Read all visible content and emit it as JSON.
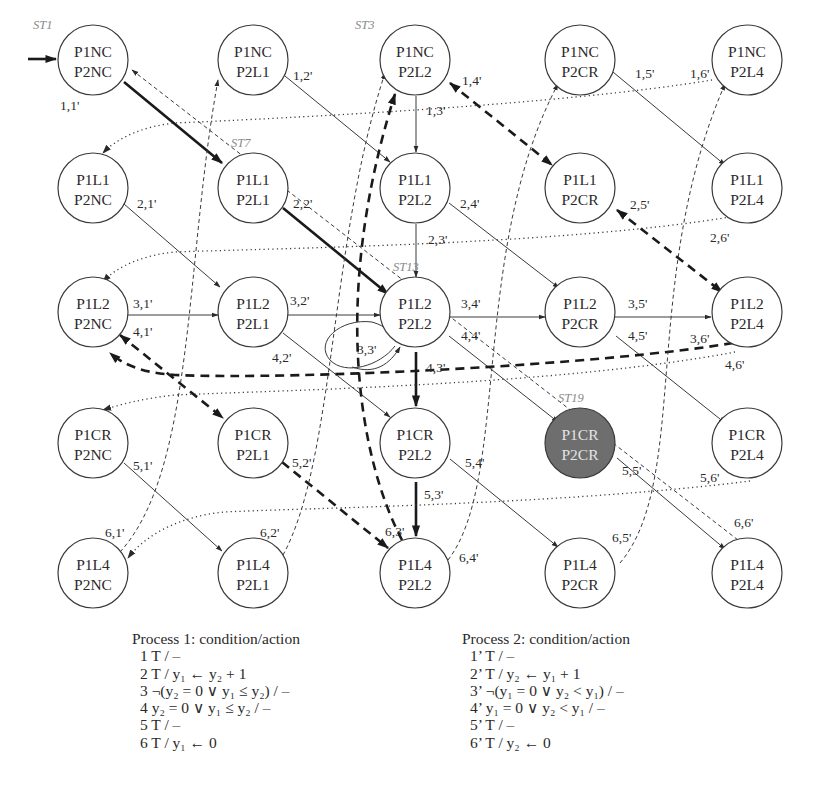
{
  "diagram": {
    "type": "state-transition-graph",
    "initial_state": "ST1",
    "columns_x": [
      93,
      253,
      415,
      580,
      747
    ],
    "rows_y": [
      60,
      188,
      312,
      443,
      573
    ],
    "radius": 35,
    "nodes": [
      {
        "id": "n00",
        "r": 0,
        "c": 0,
        "l1": "P1NC",
        "l2": "P2NC",
        "st": "ST1"
      },
      {
        "id": "n01",
        "r": 0,
        "c": 1,
        "l1": "P1NC",
        "l2": "P2L1"
      },
      {
        "id": "n02",
        "r": 0,
        "c": 2,
        "l1": "P1NC",
        "l2": "P2L2",
        "st": "ST3"
      },
      {
        "id": "n03",
        "r": 0,
        "c": 3,
        "l1": "P1NC",
        "l2": "P2CR"
      },
      {
        "id": "n04",
        "r": 0,
        "c": 4,
        "l1": "P1NC",
        "l2": "P2L4"
      },
      {
        "id": "n10",
        "r": 1,
        "c": 0,
        "l1": "P1L1",
        "l2": "P2NC"
      },
      {
        "id": "n11",
        "r": 1,
        "c": 1,
        "l1": "P1L1",
        "l2": "P2L1",
        "st": "ST7"
      },
      {
        "id": "n12",
        "r": 1,
        "c": 2,
        "l1": "P1L1",
        "l2": "P2L2"
      },
      {
        "id": "n13",
        "r": 1,
        "c": 3,
        "l1": "P1L1",
        "l2": "P2CR"
      },
      {
        "id": "n14",
        "r": 1,
        "c": 4,
        "l1": "P1L1",
        "l2": "P2L4"
      },
      {
        "id": "n20",
        "r": 2,
        "c": 0,
        "l1": "P1L2",
        "l2": "P2NC"
      },
      {
        "id": "n21",
        "r": 2,
        "c": 1,
        "l1": "P1L2",
        "l2": "P2L1"
      },
      {
        "id": "n22",
        "r": 2,
        "c": 2,
        "l1": "P1L2",
        "l2": "P2L2",
        "st": "ST13"
      },
      {
        "id": "n23",
        "r": 2,
        "c": 3,
        "l1": "P1L2",
        "l2": "P2CR"
      },
      {
        "id": "n24",
        "r": 2,
        "c": 4,
        "l1": "P1L2",
        "l2": "P2L4"
      },
      {
        "id": "n30",
        "r": 3,
        "c": 0,
        "l1": "P1CR",
        "l2": "P2NC"
      },
      {
        "id": "n31",
        "r": 3,
        "c": 1,
        "l1": "P1CR",
        "l2": "P2L1"
      },
      {
        "id": "n32",
        "r": 3,
        "c": 2,
        "l1": "P1CR",
        "l2": "P2L2"
      },
      {
        "id": "n33",
        "r": 3,
        "c": 3,
        "l1": "P1CR",
        "l2": "P2CR",
        "st": "ST19",
        "goal": true
      },
      {
        "id": "n34",
        "r": 3,
        "c": 4,
        "l1": "P1CR",
        "l2": "P2L4"
      },
      {
        "id": "n40",
        "r": 4,
        "c": 0,
        "l1": "P1L4",
        "l2": "P2NC"
      },
      {
        "id": "n41",
        "r": 4,
        "c": 1,
        "l1": "P1L4",
        "l2": "P2L1"
      },
      {
        "id": "n42",
        "r": 4,
        "c": 2,
        "l1": "P1L4",
        "l2": "P2L2"
      },
      {
        "id": "n43",
        "r": 4,
        "c": 3,
        "l1": "P1L4",
        "l2": "P2CR"
      },
      {
        "id": "n44",
        "r": 4,
        "c": 4,
        "l1": "P1L4",
        "l2": "P2L4"
      }
    ],
    "edge_labels": [
      {
        "text": "1,1'",
        "x": 60,
        "y": 110
      },
      {
        "text": "1,2'",
        "x": 293,
        "y": 80
      },
      {
        "text": "1,3'",
        "x": 426,
        "y": 115
      },
      {
        "text": "1,4'",
        "x": 462,
        "y": 85
      },
      {
        "text": "1,5'",
        "x": 635,
        "y": 78
      },
      {
        "text": "1,6'",
        "x": 690,
        "y": 78
      },
      {
        "text": "2,1'",
        "x": 137,
        "y": 208
      },
      {
        "text": "2,2'",
        "x": 293,
        "y": 208
      },
      {
        "text": "2,3'",
        "x": 428,
        "y": 244
      },
      {
        "text": "2,4'",
        "x": 460,
        "y": 208
      },
      {
        "text": "2,5'",
        "x": 630,
        "y": 209
      },
      {
        "text": "2,6'",
        "x": 710,
        "y": 242
      },
      {
        "text": "3,1'",
        "x": 133,
        "y": 308
      },
      {
        "text": "3,2'",
        "x": 290,
        "y": 305
      },
      {
        "text": "3,3'",
        "x": 357,
        "y": 354
      },
      {
        "text": "3,4'",
        "x": 461,
        "y": 308
      },
      {
        "text": "3,5'",
        "x": 628,
        "y": 308
      },
      {
        "text": "3,6'",
        "x": 690,
        "y": 343
      },
      {
        "text": "4,1'",
        "x": 133,
        "y": 336
      },
      {
        "text": "4,2'",
        "x": 272,
        "y": 362
      },
      {
        "text": "4,3'",
        "x": 426,
        "y": 372
      },
      {
        "text": "4,4'",
        "x": 461,
        "y": 340
      },
      {
        "text": "4,5'",
        "x": 628,
        "y": 340
      },
      {
        "text": "4,6'",
        "x": 725,
        "y": 369
      },
      {
        "text": "5,1'",
        "x": 133,
        "y": 470
      },
      {
        "text": "5,2'",
        "x": 292,
        "y": 467
      },
      {
        "text": "5,3'",
        "x": 424,
        "y": 499
      },
      {
        "text": "5,4'",
        "x": 465,
        "y": 467
      },
      {
        "text": "5,5'",
        "x": 622,
        "y": 475
      },
      {
        "text": "5,6'",
        "x": 700,
        "y": 482
      },
      {
        "text": "6,1'",
        "x": 105,
        "y": 537
      },
      {
        "text": "6,2'",
        "x": 260,
        "y": 537
      },
      {
        "text": "6,3'",
        "x": 385,
        "y": 536
      },
      {
        "text": "6,4'",
        "x": 459,
        "y": 562
      },
      {
        "text": "6,5'",
        "x": 612,
        "y": 542
      },
      {
        "text": "6,6'",
        "x": 734,
        "y": 527
      }
    ]
  },
  "legend": {
    "process1": {
      "title": "Process 1: condition/action",
      "rows": [
        "1 T / –",
        "2 T / y₁ ← y₂ + 1",
        "3 ¬(y₂ = 0 ∨ y₁ ≤ y₂) / –",
        "4 y₂ = 0 ∨ y₁ ≤ y₂ / –",
        "5 T / –",
        "6 T / y₁ ← 0"
      ]
    },
    "process2": {
      "title": "Process 2: condition/action",
      "rows": [
        "1’ T / –",
        "2’ T / y₂ ← y₁ + 1",
        "3’ ¬(y₁ = 0 ∨ y₂ < y₁) / –",
        "4’ y₁ = 0 ∨ y₂ < y₁ / –",
        "5’ T / –",
        "6’ T / y₂ ← 0"
      ]
    }
  }
}
